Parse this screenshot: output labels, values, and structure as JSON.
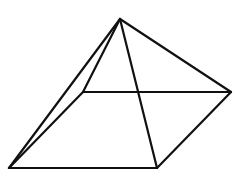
{
  "diagram": {
    "type": "square-pyramid-perspective",
    "stroke_color": "#111111",
    "background": "#ffffff",
    "vertices": {
      "apex": [
        120,
        19
      ],
      "back_left": [
        83,
        92
      ],
      "right": [
        231,
        92
      ],
      "front_left": [
        9,
        168
      ],
      "front_right": [
        157,
        168
      ]
    },
    "edges": [
      [
        "apex",
        "back_left"
      ],
      [
        "apex",
        "right"
      ],
      [
        "apex",
        "front_left"
      ],
      [
        "apex",
        "front_right"
      ],
      [
        "back_left",
        "right"
      ],
      [
        "back_left",
        "front_left"
      ],
      [
        "front_left",
        "front_right"
      ],
      [
        "front_right",
        "right"
      ]
    ]
  }
}
